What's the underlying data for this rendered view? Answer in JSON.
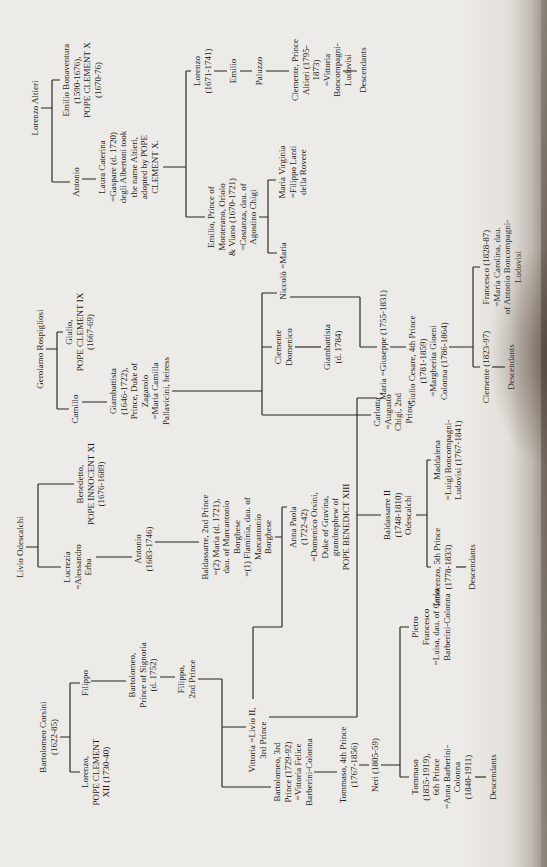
{
  "document": {
    "kind": "scanned genealogy chart, rotated sideways on page",
    "families": [
      "Corsini",
      "Odescalchi",
      "Rospigliosi",
      "Altieri"
    ],
    "ink_color": "#26241f",
    "paper_color": "#edebe7"
  },
  "nodes": [
    {
      "id": "corsini-head",
      "family": "Corsini",
      "text": "Bartolomeo Corsini\n(1622-85)"
    },
    {
      "id": "filippo-i",
      "family": "Corsini",
      "text": "Filippo"
    },
    {
      "id": "lorenzo-clement-xii",
      "family": "Corsini",
      "text": "Lorenzo,\nPOPE CLEMENT\nXII (1730-40)"
    },
    {
      "id": "bartolomeo-signoria",
      "family": "Corsini",
      "text": "Bartolomeo,\nPrince of Signoria\n(d. 1752)"
    },
    {
      "id": "filippo-2nd",
      "family": "Corsini",
      "text": "Filippo,\n2nd Prince"
    },
    {
      "id": "vittoria-livio-ii",
      "family": "Corsini",
      "text": "Vittoria =Livio II,\n3rd Prince"
    },
    {
      "id": "bartolomeo-3rd",
      "family": "Corsini",
      "text": "Bartolomeo, 3rd\nPrince (1729-92)\n=Vittoria Felice\nBarberini-Colonna"
    },
    {
      "id": "tommaso-4th",
      "family": "Corsini",
      "text": "Tommaso, 4th Prince\n(1767-1856)"
    },
    {
      "id": "neri",
      "family": "Corsini",
      "text": "Neri (1805-59)"
    },
    {
      "id": "tommaso-6th",
      "family": "Corsini",
      "text": "Tommaso\n(1835-1919),\n6th Prince\n=Anna Barberini-\nColonna\n(1840-1911)"
    },
    {
      "id": "corsini-descendants",
      "family": "Corsini",
      "text": "Descendants"
    },
    {
      "id": "pietro-francesco",
      "family": "Corsini",
      "text": "Pietro\nFrancesco\n=Luisa, dau. of Carlo\nBarberini-Colonna"
    },
    {
      "id": "odescalchi-head",
      "family": "Odescalchi",
      "text": "Livio Odescalchi"
    },
    {
      "id": "lucrezia",
      "family": "Odescalchi",
      "text": "Lucrezia\n=Alessandro\nErba"
    },
    {
      "id": "benedetto-innocent-xi",
      "family": "Odescalchi",
      "text": "Benedetto,\nPOPE INNOCENT XI\n(1676-1689)"
    },
    {
      "id": "antonio-odescalchi",
      "family": "Odescalchi",
      "text": "Antonio\n(1683-1746)"
    },
    {
      "id": "baldassarre-2nd",
      "family": "Odescalchi",
      "text": "Baldassarre, 2nd Prince\n=(2) Maria (d. 1721),\ndau. of Marcantonio\nBorghese\n=(1) Flaminia, dau. of\nMarcantonio\nBorghese"
    },
    {
      "id": "anna-paola",
      "family": "Odescalchi",
      "text": "Anna Paola\n(1722-42)\n=Domenico Orsini,\nDuke of Gravina,\ngrandnephew of\nPOPE BENEDICT XIII"
    },
    {
      "id": "baldassarre-ii",
      "family": "Odescalchi",
      "text": "Baldassarre II\n(1748-1810)\nOdescalchi"
    },
    {
      "id": "innocenzo-5th",
      "family": "Odescalchi",
      "text": "Innocenzo, 5th Prince\n(1778-1833)"
    },
    {
      "id": "odescalchi-descendants",
      "family": "Odescalchi",
      "text": "Descendants"
    },
    {
      "id": "maddalena",
      "family": "Odescalchi",
      "text": "Maddalena\n=Luigi Boncompagni-\nLudovisi (1767-1841)"
    },
    {
      "id": "maria-giuseppe",
      "family": "Odescalchi-Rospigliosi",
      "text": "Maria =Giuseppe (1755-1831)"
    },
    {
      "id": "rospigliosi-head",
      "family": "Rospigliosi",
      "text": "Gerolamo Rospigliosi"
    },
    {
      "id": "camillo",
      "family": "Rospigliosi",
      "text": "Camillo"
    },
    {
      "id": "giulio-clement-ix",
      "family": "Rospigliosi",
      "text": "Giulio,\nPOPE CLEMENT IX\n(1667-69)"
    },
    {
      "id": "giambattista-zagarolo",
      "family": "Rospigliosi",
      "text": "Giambattista\n(1646-1722),\nPrince, Duke of\nZagarolo\n=Maria Camilla\nPallavicini, heiress"
    },
    {
      "id": "carlotta",
      "family": "Rospigliosi",
      "text": "Carlotta\n=Augusto\nChigi, 2nd\nPrince"
    },
    {
      "id": "clemente-domenico",
      "family": "Rospigliosi",
      "text": "Clemente\nDomenico"
    },
    {
      "id": "giambattista-1784",
      "family": "Rospigliosi",
      "text": "Giambattista\n(d. 1784)"
    },
    {
      "id": "niccolo-maria",
      "family": "Rospigliosi-Altieri",
      "text": "Niccolò =Maria"
    },
    {
      "id": "giulio-cesare-4th",
      "family": "Rospigliosi",
      "text": "Giulio Cesare, 4th Prince\n(1781-1859)\n=Margherita Gioeni\nColonna (1786-1864)"
    },
    {
      "id": "clemente-1823",
      "family": "Rospigliosi",
      "text": "Clemente (1823-97)"
    },
    {
      "id": "rospigliosi-descendants",
      "family": "Rospigliosi",
      "text": "Descendants"
    },
    {
      "id": "francesco-1828",
      "family": "Rospigliosi",
      "text": "Francesco (1828-87)\n=Maria Carolina, dau.\nof Antonio Boncompagni-\nLudovisi"
    },
    {
      "id": "altieri-head",
      "family": "Altieri",
      "text": "Lorenzo Altieri"
    },
    {
      "id": "antonio-altieri",
      "family": "Altieri",
      "text": "Antonio"
    },
    {
      "id": "emilio-bonaventura",
      "family": "Altieri",
      "text": "Emilio Bonaventura\n(1590-1676),\nPOPE CLEMENT X\n(1670-76)"
    },
    {
      "id": "laura-caterina",
      "family": "Altieri",
      "text": "Laura Caterina\n=Gaspare (d. 1720)\ndegli Albertoni took\nthe name Altieri,\nadopted by POPE\nCLEMENT X."
    },
    {
      "id": "emilio-monterano",
      "family": "Altieri",
      "text": "Emilio, Prince of\nMonterano, Oriolo\n& Viano (1670-1721)\n=Costanza, dau. of\nAgostino Chigi"
    },
    {
      "id": "lorenzo-1671",
      "family": "Altieri",
      "text": "Lorenzo\n(1671-1741)"
    },
    {
      "id": "emilio-altieri",
      "family": "Altieri",
      "text": "Emilio"
    },
    {
      "id": "paluzzo",
      "family": "Altieri",
      "text": "Paluzzo"
    },
    {
      "id": "clemente-prince-altieri",
      "family": "Altieri",
      "text": "Clemente, Prince\nAltieri (1795-1873)\n=Vittoria\nBoncompagni-\nLudovisi"
    },
    {
      "id": "altieri-descendants",
      "family": "Altieri",
      "text": "Descendants"
    },
    {
      "id": "maria-virginia",
      "family": "Altieri",
      "text": "Maria Virginia\n=Filippo Lanti\ndella Rovere"
    }
  ]
}
